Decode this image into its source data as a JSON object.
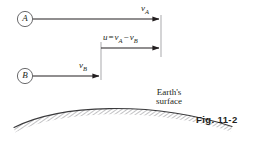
{
  "figure": {
    "caption": "Fig. 11-2",
    "nodes": [
      {
        "id": "A",
        "label": "A",
        "cx": 25,
        "cy": 19,
        "r": 7.5
      },
      {
        "id": "B",
        "label": "B",
        "cx": 25,
        "cy": 76,
        "r": 7.5
      }
    ],
    "vectors": [
      {
        "name": "v_A",
        "label_main": "v",
        "label_sub": "A",
        "x1": 33,
        "y1": 19,
        "x2": 160,
        "y2": 19
      },
      {
        "name": "u",
        "label_main": "u",
        "label_eq": "=",
        "label_term1": "v",
        "label_term1_sub": "A",
        "label_minus": "−",
        "label_term2": "v",
        "label_term2_sub": "B",
        "x1": 101,
        "y1": 48,
        "x2": 160,
        "y2": 48
      },
      {
        "name": "v_B",
        "label_main": "v",
        "label_sub": "B",
        "x1": 33,
        "y1": 76,
        "x2": 101,
        "y2": 76
      }
    ],
    "reference_lines": [
      {
        "name": "right-reference-line",
        "x": 161,
        "y1": 15,
        "y2": 57
      },
      {
        "name": "left-reference-line",
        "x": 101,
        "y1": 42,
        "y2": 80
      }
    ],
    "earth": {
      "label_line1": "Earth's",
      "label_line2": "surface"
    },
    "colors": {
      "ink": "#231f20",
      "line": "#3a3a3c",
      "hatch": "#8a8a8d",
      "background": "#ffffff"
    }
  }
}
